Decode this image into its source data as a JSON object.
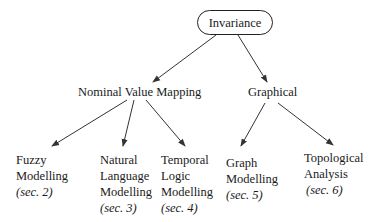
{
  "root": {
    "label": "Invariance"
  },
  "level1": [
    {
      "label": "Nominal Value Mapping"
    },
    {
      "label": "Graphical"
    }
  ],
  "leaves": [
    {
      "lines": [
        "Fuzzy",
        "Modelling"
      ],
      "section": "(sec. 2)"
    },
    {
      "lines": [
        "Natural",
        "Language",
        "Modelling"
      ],
      "section": "(sec. 3)"
    },
    {
      "lines": [
        "Temporal",
        "Logic",
        "Modelling"
      ],
      "section": "(sec. 4)"
    },
    {
      "lines": [
        "Graph",
        "Modelling"
      ],
      "section": "(sec. 5)"
    },
    {
      "lines": [
        "Topological",
        "Analysis"
      ],
      "section": "(sec. 6)"
    }
  ],
  "colors": {
    "line": "#333333",
    "text": "#1a1a1a",
    "background": "#ffffff"
  }
}
